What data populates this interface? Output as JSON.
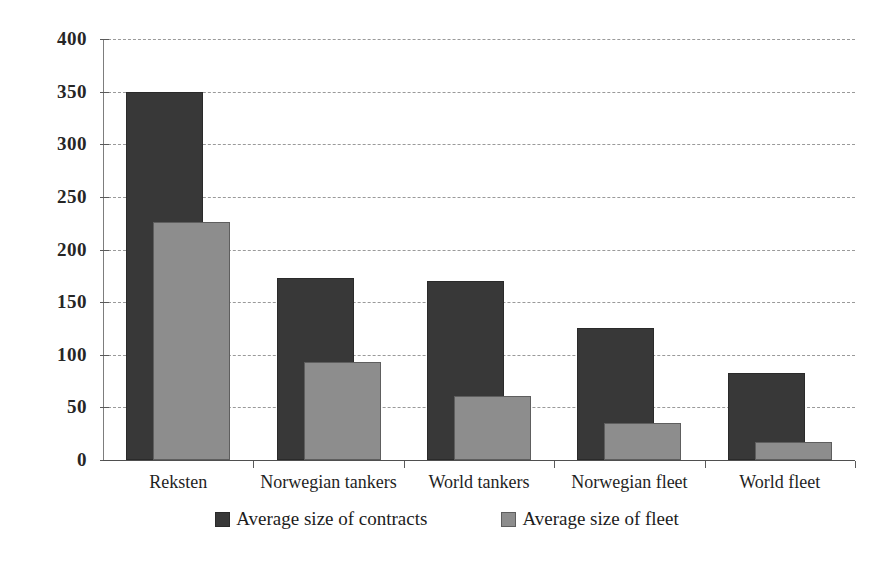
{
  "chart_data": {
    "type": "bar",
    "title": "",
    "subtitle": "",
    "xlabel": "",
    "ylabel": "",
    "ylim": [
      0,
      400
    ],
    "yticks": [
      0,
      50,
      100,
      150,
      200,
      250,
      300,
      350,
      400
    ],
    "ytick_labels": [
      "0",
      "50",
      "100",
      "150",
      "200",
      "250",
      "300",
      "350",
      "400"
    ],
    "grid": true,
    "grid_style": "dashed-horizontal",
    "legend_position": "bottom-center",
    "bar_style": "overlapped",
    "categories": [
      "Reksten",
      "Norwegian tankers",
      "World tankers",
      "Norwegian fleet",
      "World fleet"
    ],
    "series": [
      {
        "name": "Average size of contracts",
        "color": "#383838",
        "values": [
          350,
          173,
          170,
          125,
          83
        ]
      },
      {
        "name": "Average size of fleet",
        "color": "#8d8d8d",
        "values": [
          226,
          93,
          61,
          35,
          17
        ]
      }
    ],
    "legend": [
      {
        "label": "Average size of contracts",
        "swatch": "dark"
      },
      {
        "label": "Average size of fleet",
        "swatch": "light"
      }
    ]
  },
  "colors": {
    "series_dark": "#383838",
    "series_light": "#8d8d8d",
    "axis": "#4f4f4f",
    "grid": "#9a9a9a",
    "text": "#1f1f1f",
    "background": "#ffffff"
  }
}
